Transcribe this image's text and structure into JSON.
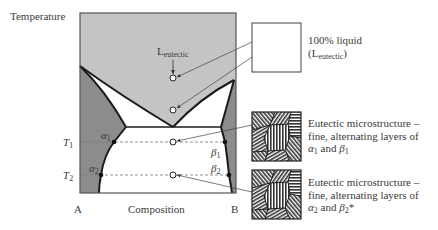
{
  "diagram": {
    "y_axis_label": "Temperature",
    "x_axis_label": "Composition",
    "x_left_label": "A",
    "x_right_label": "B",
    "temperature_levels": [
      {
        "label": "T",
        "sub": "1"
      },
      {
        "label": "T",
        "sub": "2"
      }
    ],
    "liquid_label": {
      "main": "L",
      "sub": "eutectic"
    },
    "phase_points": {
      "alpha1": {
        "sym": "α",
        "sub": "1"
      },
      "alpha2": {
        "sym": "α",
        "sub": "2"
      },
      "beta1": {
        "sym": "β",
        "sub": "1"
      },
      "beta2": {
        "sym": "β",
        "sub": "2"
      }
    },
    "colors": {
      "liquid_region": "#c4c4c4",
      "solid_solution_region": "#8c8c8c",
      "two_phase_region": "#ffffff",
      "lines": "#1a1a1a"
    }
  },
  "callouts": [
    {
      "id": "liquid",
      "line1": "100% liquid",
      "line2_open": "(L",
      "line2_sub": "eutectic",
      "line2_close": ")"
    },
    {
      "id": "micro1",
      "line1": "Eutectic microstructure –",
      "line2": "fine, alternating layers of",
      "line3_a": "α",
      "line3_a_sub": "1",
      "line3_mid": " and ",
      "line3_b": "β",
      "line3_b_sub": "1",
      "line3_end": ""
    },
    {
      "id": "micro2",
      "line1": "Eutectic microstructure –",
      "line2": "fine, alternating layers of",
      "line3_a": "α",
      "line3_a_sub": "2",
      "line3_mid": " and ",
      "line3_b": "β",
      "line3_b_sub": "2",
      "line3_end": "*"
    }
  ]
}
